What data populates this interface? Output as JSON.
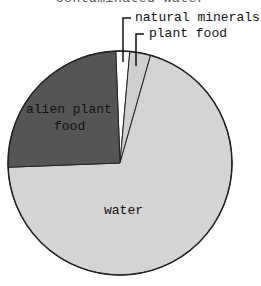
{
  "chart_data": {
    "type": "pie",
    "title": "contaminated water",
    "start_angle": "12 o'clock",
    "direction": "clockwise",
    "slices": [
      {
        "label": "natural minerals",
        "value": 2,
        "color": "#ffffff"
      },
      {
        "label": "plant food",
        "value": 3,
        "color": "#cfcfcf"
      },
      {
        "label": "water",
        "value": 70,
        "color": "#d4d4d4"
      },
      {
        "label": "alien plant food",
        "value": 25,
        "color": "#555555"
      }
    ],
    "categories": [
      "natural minerals",
      "plant food",
      "water",
      "alien plant food"
    ],
    "values": [
      2,
      3,
      70,
      25
    ],
    "legend": "none (callout labels)"
  },
  "labels": {
    "title": "contaminated water",
    "natural_minerals": "natural minerals",
    "plant_food": "plant food",
    "alien_1": "alien plant",
    "alien_2": "food",
    "water": "water"
  }
}
